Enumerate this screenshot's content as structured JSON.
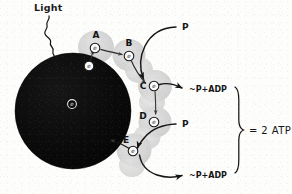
{
  "diagram": {
    "title_label": "Light",
    "reaction_center": {
      "name": "reaction-center-chlorophyll",
      "electron_label": "e"
    },
    "carriers": [
      {
        "id": "A",
        "label": "A",
        "electron_label": "e"
      },
      {
        "id": "B",
        "label": "B",
        "electron_label": "e"
      },
      {
        "id": "C",
        "label": "C",
        "electron_label": "e"
      },
      {
        "id": "D",
        "label": "D",
        "electron_label": "e"
      },
      {
        "id": "E",
        "label": "E",
        "electron_label": "e"
      }
    ],
    "released_electron_label": "e",
    "phosphate_inputs": [
      {
        "id": "p-top",
        "label": "P"
      },
      {
        "id": "p-bottom",
        "label": "P"
      }
    ],
    "atp_outputs": [
      {
        "id": "adp-top",
        "label": "~P+ADP"
      },
      {
        "id": "adp-bottom",
        "label": "~P+ADP"
      }
    ],
    "summary_label": "= 2 ATP",
    "colors": {
      "ink": "#141414",
      "chlorophyll_fill": "#080808",
      "carrier_fill": "#d6d6d6",
      "paper": "#fdfdfb"
    }
  }
}
